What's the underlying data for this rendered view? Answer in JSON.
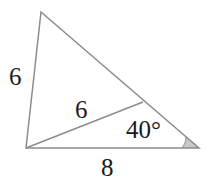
{
  "figure": {
    "type": "triangle-with-cevian",
    "stroke_color": "#8c8c8c",
    "text_color": "#1a1a1a",
    "angle_fill_color": "#c9c9c9",
    "background_color": "#ffffff",
    "labels": {
      "left_side": "6",
      "cevian": "6",
      "base": "8",
      "angle": "40°"
    },
    "geometry": {
      "apex": {
        "x": 41,
        "y": 12
      },
      "bottom_left": {
        "x": 26,
        "y": 148
      },
      "bottom_right": {
        "x": 199,
        "y": 148
      },
      "cevian_point": {
        "x": 143,
        "y": 102
      },
      "angle_arc_radius": 17
    }
  }
}
